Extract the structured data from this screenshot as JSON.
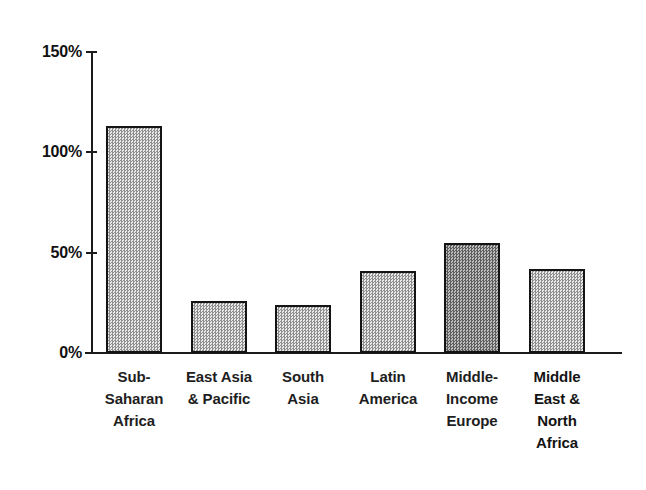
{
  "chart_data": {
    "type": "bar",
    "title": "",
    "title_note": "title cropped off above top edge of image",
    "xlabel": "",
    "ylabel": "",
    "ylim": [
      0,
      150
    ],
    "yunit": "%",
    "grid": false,
    "legend": false,
    "ytick_labels": [
      "150%",
      "100%",
      "50%",
      "0%"
    ],
    "ytick_values": [
      150,
      100,
      50,
      0
    ],
    "categories": [
      "Sub-Saharan Africa",
      "East Asia & Pacific",
      "South Asia",
      "Latin America",
      "Middle-Income Europe",
      "Middle East & North Africa"
    ],
    "category_lines": [
      [
        "Sub-",
        "Saharan",
        "Africa"
      ],
      [
        "East Asia",
        "& Pacific"
      ],
      [
        "South",
        "Asia"
      ],
      [
        "Latin",
        "America"
      ],
      [
        "Middle-",
        "Income",
        "Europe"
      ],
      [
        "Middle",
        "East &",
        "North",
        "Africa"
      ]
    ],
    "values": [
      113,
      26,
      24,
      41,
      55,
      42
    ],
    "bar_fill": "gray-dither-checker",
    "bar_edge_color": "#141414"
  },
  "axis": {
    "ticks": [
      {
        "label": "150%",
        "value": 150
      },
      {
        "label": "100%",
        "value": 100
      },
      {
        "label": "50%",
        "value": 50
      },
      {
        "label": "0%",
        "value": 0
      }
    ]
  }
}
